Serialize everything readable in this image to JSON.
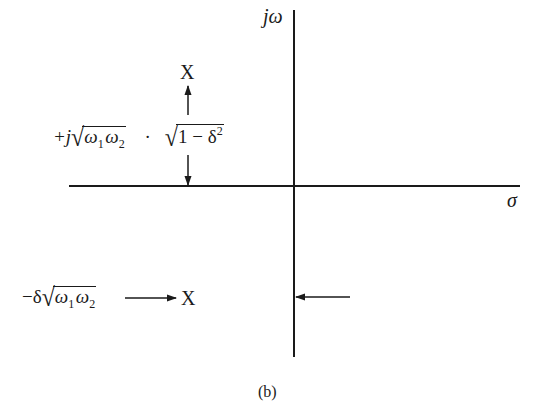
{
  "diagram": {
    "type": "s-plane pole plot",
    "axes": {
      "vertical_label": "jω",
      "horizontal_label": "σ"
    },
    "poles": [
      {
        "marker": "X",
        "position": "upper-left, above real axis"
      },
      {
        "marker": "X",
        "position": "lower-left, below real axis"
      }
    ],
    "annotations": {
      "imag_part": {
        "prefix": "+j",
        "radicand1_a": "ω",
        "radicand1_a_sub": "1",
        "radicand1_b": "ω",
        "radicand1_b_sub": "2",
        "dot": "·",
        "radicand2_a": "1 − δ",
        "radicand2_sup": "2"
      },
      "real_part": {
        "prefix": "−δ",
        "radicand_a": "ω",
        "radicand_a_sub": "1",
        "radicand_b": "ω",
        "radicand_b_sub": "2"
      }
    },
    "pole_marker_upper": "X",
    "pole_marker_lower": "X",
    "caption": "(b)"
  },
  "colors": {
    "ink": "#1a1a1a",
    "background": "#ffffff"
  }
}
